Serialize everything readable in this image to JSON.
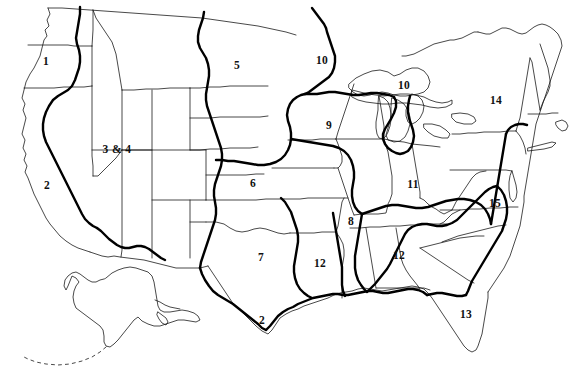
{
  "map": {
    "title": "United States region map",
    "background_color": "#ffffff",
    "state_border_color": "#1a1a1a",
    "region_border_color": "#000000",
    "label_color": "#111111",
    "state_border_width": 0.8,
    "region_border_width": 2.4,
    "width": 576,
    "height": 375
  },
  "labels": [
    {
      "id": "region-1",
      "text": "1",
      "x": 46,
      "y": 62
    },
    {
      "id": "region-2-west",
      "text": "2",
      "x": 47,
      "y": 186
    },
    {
      "id": "region-3-and-4",
      "text": "3 & 4",
      "x": 117,
      "y": 150
    },
    {
      "id": "region-5",
      "text": "5",
      "x": 237,
      "y": 66
    },
    {
      "id": "region-6",
      "text": "6",
      "x": 253,
      "y": 184
    },
    {
      "id": "region-7",
      "text": "7",
      "x": 261,
      "y": 258
    },
    {
      "id": "region-8",
      "text": "8",
      "x": 351,
      "y": 222
    },
    {
      "id": "region-9",
      "text": "9",
      "x": 329,
      "y": 126
    },
    {
      "id": "region-10-north",
      "text": "10",
      "x": 322,
      "y": 61
    },
    {
      "id": "region-10-lakes",
      "text": "10",
      "x": 404,
      "y": 86
    },
    {
      "id": "region-11",
      "text": "11",
      "x": 413,
      "y": 185
    },
    {
      "id": "region-12-west",
      "text": "12",
      "x": 320,
      "y": 264
    },
    {
      "id": "region-12-east",
      "text": "12",
      "x": 399,
      "y": 256
    },
    {
      "id": "region-13",
      "text": "13",
      "x": 466,
      "y": 315
    },
    {
      "id": "region-14",
      "text": "14",
      "x": 496,
      "y": 101
    },
    {
      "id": "region-15",
      "text": "15",
      "x": 495,
      "y": 204
    },
    {
      "id": "region-2-south",
      "text": "2",
      "x": 262,
      "y": 321
    }
  ],
  "insets": [
    {
      "id": "alaska-inset",
      "name": "Alaska"
    }
  ]
}
